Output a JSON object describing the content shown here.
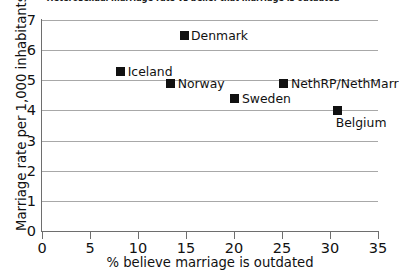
{
  "chart_data": {
    "type": "scatter",
    "title": "Heterosexual marriage rate vs belief that marriage is outdated",
    "xlabel": "% believe marriage is outdated",
    "ylabel": "Marriage rate per 1,000 inhabitants",
    "xlim": [
      0,
      35
    ],
    "ylim": [
      0,
      7
    ],
    "xticks": [
      0,
      5,
      10,
      15,
      20,
      25,
      30,
      35
    ],
    "yticks": [
      0,
      1,
      2,
      3,
      4,
      5,
      6,
      7
    ],
    "xtick_labels": [
      "0",
      "5",
      "10",
      "15",
      "20",
      "25",
      "30",
      "35"
    ],
    "ytick_labels": [
      "0",
      "1",
      "2",
      "3",
      "4",
      "5",
      "6",
      "7"
    ],
    "grid": "horizontal",
    "legend": "none",
    "marker_color": "#111111",
    "marker_shape": "square",
    "points": [
      {
        "label": "Denmark",
        "x": 14.8,
        "y": 6.5,
        "label_pos": "right"
      },
      {
        "label": "Iceland",
        "x": 8.2,
        "y": 5.3,
        "label_pos": "right"
      },
      {
        "label": "Norway",
        "x": 13.4,
        "y": 4.9,
        "label_pos": "right"
      },
      {
        "label": "Sweden",
        "x": 20.1,
        "y": 4.4,
        "label_pos": "right"
      },
      {
        "label": "NethRP/NethMarr",
        "x": 25.2,
        "y": 4.9,
        "label_pos": "right"
      },
      {
        "label": "Belgium",
        "x": 30.8,
        "y": 4.0,
        "label_pos": "below"
      }
    ]
  }
}
